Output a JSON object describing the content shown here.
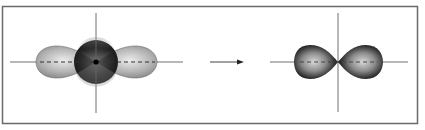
{
  "figure": {
    "colors": {
      "frame": "#6a6a6a",
      "axis": "#707070",
      "s_orbital_dark": "#1e1e1e",
      "p_lobe_gray": "#8a8a8a",
      "p_lobe_highlight": "#e6e6e6",
      "hybrid_dark": "#161616",
      "hybrid_highlight": "#cfcfcf",
      "arrow": "#333333"
    },
    "left_panel": {
      "label": "",
      "components": [
        "s-orbital (sphere)",
        "p-orbital (two lobes)",
        "x-axis",
        "y-axis",
        "nucleus"
      ]
    },
    "arrow": {
      "direction": "right",
      "label": ""
    },
    "right_panel": {
      "label": "",
      "components": [
        "hybrid orbital (two dark lobes)",
        "x-axis",
        "y-axis"
      ]
    }
  }
}
